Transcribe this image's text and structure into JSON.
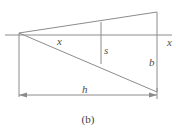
{
  "figure": {
    "caption": "(b)",
    "line_color": "#8c8c8c",
    "label_color": "#4d4d4d",
    "background": "#ffffff",
    "labels": {
      "x_mid": "x",
      "x_axis": "x",
      "s": "s",
      "b": "b",
      "h": "h"
    },
    "geometry": {
      "apex": [
        19,
        33
      ],
      "axis_line": {
        "x1": 5,
        "y1": 35,
        "x2": 172,
        "y2": 35
      },
      "upper_ray": {
        "x1": 19,
        "y1": 33,
        "x2": 157,
        "y2": 12
      },
      "lower_ray": {
        "x1": 19,
        "y1": 33,
        "x2": 157,
        "y2": 92
      },
      "right_vertical": {
        "x": 157,
        "y1": 12,
        "y2": 92
      },
      "mid_vertical": {
        "x": 101,
        "y1": 22,
        "y2": 64
      },
      "left_extension": {
        "x": 19,
        "y1": 33,
        "y2": 97
      },
      "right_extension": {
        "x": 157,
        "y1": 92,
        "y2": 99
      },
      "dimension_line": {
        "y": 95,
        "x1": 19,
        "x2": 157
      }
    }
  }
}
